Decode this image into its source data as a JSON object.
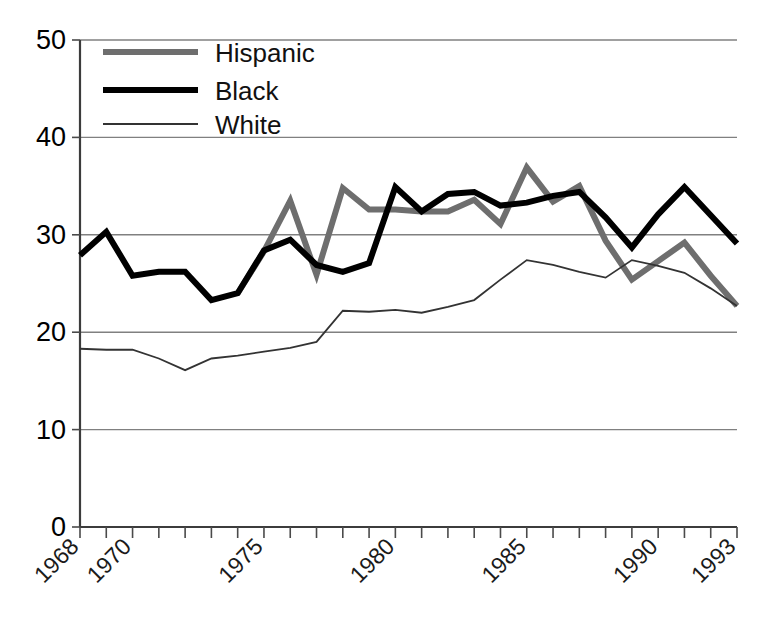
{
  "chart_data": {
    "type": "line",
    "title": "",
    "subtitle": "",
    "xlabel": "",
    "ylabel": "",
    "xlim": [
      1968,
      1993
    ],
    "ylim": [
      0,
      50
    ],
    "grid": "horizontal",
    "legend_position": "top-left",
    "x": [
      1968,
      1969,
      1970,
      1971,
      1972,
      1973,
      1974,
      1975,
      1976,
      1977,
      1978,
      1979,
      1980,
      1981,
      1982,
      1983,
      1984,
      1985,
      1986,
      1987,
      1988,
      1989,
      1990,
      1991,
      1992,
      1993
    ],
    "xtick_labels": [
      "1968",
      "1970",
      "1975",
      "1980",
      "1985",
      "1990",
      "1993"
    ],
    "xtick_values": [
      1968,
      1970,
      1975,
      1980,
      1985,
      1990,
      1993
    ],
    "ytick_labels": [
      "0",
      "10",
      "20",
      "30",
      "40",
      "50"
    ],
    "ytick_values": [
      0,
      10,
      20,
      30,
      40,
      50
    ],
    "series": [
      {
        "name": "Hispanic",
        "color": "#6e6e6e",
        "line_width": 6,
        "x": [
          1974,
          1975,
          1976,
          1977,
          1978,
          1979,
          1980,
          1981,
          1982,
          1983,
          1984,
          1985,
          1986,
          1987,
          1988,
          1989,
          1990,
          1991,
          1992,
          1993
        ],
        "values": [
          24.0,
          28.3,
          33.5,
          25.9,
          34.8,
          32.6,
          32.6,
          32.4,
          32.4,
          33.6,
          31.1,
          36.9,
          33.4,
          35.0,
          29.4,
          25.4,
          27.3,
          29.2,
          25.8,
          22.7
        ]
      },
      {
        "name": "Black",
        "color": "#000000",
        "line_width": 6,
        "x": [
          1968,
          1969,
          1970,
          1971,
          1972,
          1973,
          1974,
          1975,
          1976,
          1977,
          1978,
          1979,
          1980,
          1981,
          1982,
          1983,
          1984,
          1985,
          1986,
          1987,
          1988,
          1989,
          1990,
          1991,
          1992,
          1993
        ],
        "values": [
          27.9,
          30.3,
          25.8,
          26.2,
          26.2,
          23.3,
          24.0,
          28.4,
          29.5,
          26.9,
          26.2,
          27.1,
          34.9,
          32.4,
          34.2,
          34.4,
          33.0,
          33.3,
          34.0,
          34.4,
          31.8,
          28.7,
          32.1,
          34.9,
          32.0,
          29.1
        ]
      },
      {
        "name": "White",
        "color": "#333333",
        "line_width": 1.8,
        "x": [
          1968,
          1969,
          1970,
          1971,
          1972,
          1973,
          1974,
          1975,
          1976,
          1977,
          1978,
          1979,
          1980,
          1981,
          1982,
          1983,
          1984,
          1985,
          1986,
          1987,
          1988,
          1989,
          1990,
          1991,
          1992,
          1993
        ],
        "values": [
          18.3,
          18.2,
          18.2,
          17.3,
          16.1,
          17.3,
          17.6,
          18.0,
          18.4,
          19.0,
          22.2,
          22.1,
          22.3,
          22.0,
          22.6,
          23.3,
          25.4,
          27.4,
          26.9,
          26.2,
          25.6,
          27.4,
          26.8,
          26.1,
          24.5,
          22.7
        ]
      }
    ]
  },
  "legend": {
    "entries": [
      {
        "label": "Hispanic",
        "swatch": "hispanic-line-swatch"
      },
      {
        "label": "Black",
        "swatch": "black-line-swatch"
      },
      {
        "label": "White",
        "swatch": "white-line-swatch"
      }
    ]
  },
  "axes": {
    "y_tick_0": "0",
    "y_tick_10": "10",
    "y_tick_20": "20",
    "y_tick_30": "30",
    "y_tick_40": "40",
    "y_tick_50": "50",
    "x_tick_1968": "1968",
    "x_tick_1970": "1970",
    "x_tick_1975": "1975",
    "x_tick_1980": "1980",
    "x_tick_1985": "1985",
    "x_tick_1990": "1990",
    "x_tick_1993": "1993"
  },
  "colors": {
    "hispanic": "#6e6e6e",
    "black": "#000000",
    "white": "#333333",
    "gridline": "#808080",
    "axis": "#3c3c3c",
    "background": "#ffffff"
  }
}
